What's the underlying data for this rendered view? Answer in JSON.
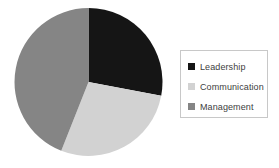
{
  "chart_data": {
    "type": "pie",
    "title": "",
    "subtitle": "",
    "xlabel": "",
    "ylabel": "",
    "grid": false,
    "legend_position": "right",
    "start_angle_deg": 0,
    "direction": "clockwise",
    "categories": [
      "Leadership",
      "Communication",
      "Management"
    ],
    "values": [
      28,
      28,
      44
    ],
    "units": "percent",
    "slices": [
      {
        "label": "Leadership",
        "value": 28,
        "percent": 28,
        "color": "#151515",
        "start_angle_deg": 0,
        "end_angle_deg": 100.8
      },
      {
        "label": "Communication",
        "value": 28,
        "percent": 28,
        "color": "#d2d2d2",
        "start_angle_deg": 100.8,
        "end_angle_deg": 201.6
      },
      {
        "label": "Management",
        "value": 44,
        "percent": 44,
        "color": "#858585",
        "start_angle_deg": 201.6,
        "end_angle_deg": 360
      }
    ],
    "geometry": {
      "center_x": 74.5,
      "center_y": 74,
      "radius": 74
    }
  },
  "legend": {
    "items": [
      {
        "label": "Leadership",
        "color": "#151515",
        "swatch_icon": "square-swatch-icon"
      },
      {
        "label": "Communication",
        "color": "#d2d2d2",
        "swatch_icon": "square-swatch-icon"
      },
      {
        "label": "Management",
        "color": "#858585",
        "swatch_icon": "square-swatch-icon"
      }
    ]
  },
  "colors": {
    "background": "#ffffff",
    "legend_border": "#c8c8c8",
    "legend_text": "#404040",
    "leadership": "#151515",
    "communication": "#d2d2d2",
    "management": "#858585"
  }
}
